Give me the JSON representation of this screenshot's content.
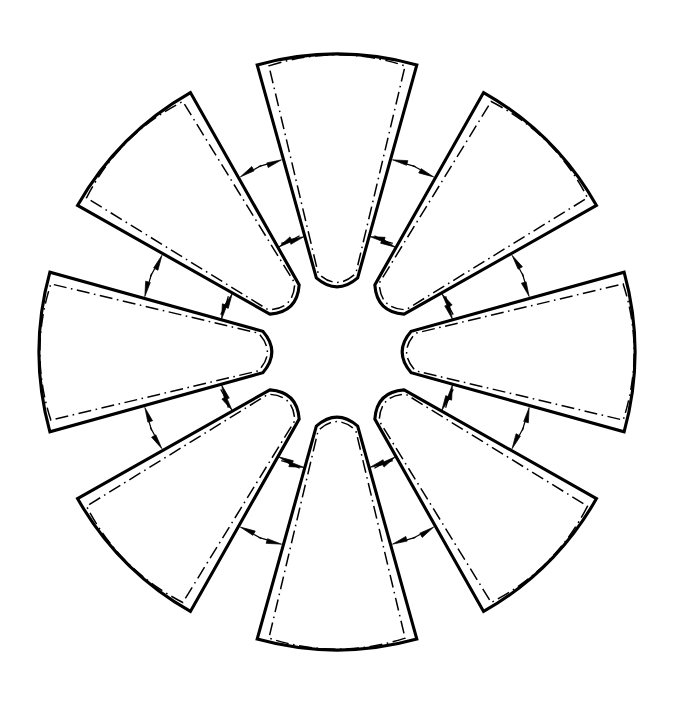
{
  "figure": {
    "background_color": "#ffffff",
    "line_color": "#000000",
    "outline_width_px": 3.1,
    "seam_line_width_px": 1.5,
    "seam_dash_pattern": "13 4.5 1.6 4.5"
  },
  "geometry": {
    "center_x": 337,
    "center_y": 352,
    "outer_radius": 298,
    "inner_radius": 77,
    "petal_count": 8,
    "petal_angular_width_deg": 33,
    "petal_gap_deg": 12,
    "angular_pitch_deg": 45,
    "seam_inset_px": 7,
    "inner_arc_sagitta_px": 9,
    "outer_arc_sagitta_px": 11,
    "corner_trim_px": 5
  },
  "petals": [
    {
      "id": "petal-top",
      "label": "Top petal",
      "center_angle_deg": -90,
      "arrow_radii": [
        200,
        120
      ]
    },
    {
      "id": "petal-top-right",
      "label": "Upper-right petal",
      "center_angle_deg": -45,
      "arrow_radii": [
        200,
        120
      ]
    },
    {
      "id": "petal-right",
      "label": "Right petal",
      "center_angle_deg": 0,
      "arrow_radii": [
        200,
        120
      ]
    },
    {
      "id": "petal-bottom-right",
      "label": "Lower-right petal",
      "center_angle_deg": 45,
      "arrow_radii": [
        200,
        120
      ]
    },
    {
      "id": "petal-bottom",
      "label": "Bottom petal",
      "center_angle_deg": 90,
      "arrow_radii": [
        200,
        120
      ]
    },
    {
      "id": "petal-bottom-left",
      "label": "Lower-left petal",
      "center_angle_deg": 135,
      "arrow_radii": [
        200,
        120
      ]
    },
    {
      "id": "petal-left",
      "label": "Left petal",
      "center_angle_deg": 180,
      "arrow_radii": [
        200,
        120
      ]
    },
    {
      "id": "petal-top-left",
      "label": "Upper-left petal",
      "center_angle_deg": 225,
      "arrow_radii": [
        200,
        120
      ]
    }
  ],
  "arrow": {
    "name": "inward-dimension-arrow",
    "head_length_px": 15,
    "head_half_width_px": 3.6,
    "tail_length_px": 9,
    "direction": "points inward toward the seam line, perpendicular to the radial edge"
  },
  "legend": {
    "solid_line": "Cut / outline edge",
    "dash_dot_line": "Seam or fold allowance line",
    "arrow": "Seam allowance direction indicator"
  }
}
